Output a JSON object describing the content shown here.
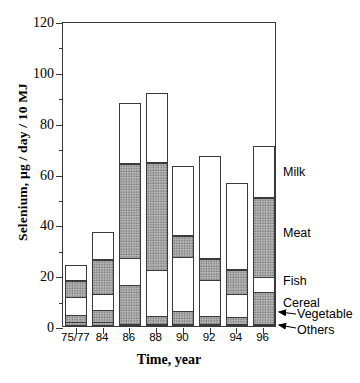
{
  "chart_data": {
    "type": "bar",
    "subtype": "stacked-vertical",
    "title": "",
    "xlabel": "Time, year",
    "ylabel": "Selenium, µg / day / 10 MJ",
    "categories": [
      "75/77",
      "84",
      "86",
      "88",
      "90",
      "92",
      "94",
      "96"
    ],
    "ylim": [
      0,
      120
    ],
    "yticks": [
      0,
      20,
      40,
      60,
      80,
      100,
      120
    ],
    "ytick_labels": [
      "0",
      "20",
      "40",
      "60",
      "80",
      "100",
      "120"
    ],
    "yminor_ticks": [
      10,
      30,
      50,
      70,
      90,
      110
    ],
    "grid": false,
    "legend_position": "right-inline-labels",
    "series": [
      {
        "name": "Others",
        "values": [
          0.8,
          0.8,
          0.8,
          0.8,
          0.8,
          0.8,
          0.8,
          0.8
        ]
      },
      {
        "name": "Vegetable",
        "values": [
          1.7,
          1.7,
          0.8,
          0.6,
          0.4,
          0.6,
          0.6,
          0.6
        ]
      },
      {
        "name": "Cereal",
        "values": [
          3.0,
          5.0,
          16.0,
          3.8,
          5.8,
          3.8,
          3.2,
          13.2
        ]
      },
      {
        "name": "Fish",
        "values": [
          7.5,
          7.0,
          10.8,
          18.2,
          21.4,
          14.6,
          9.6,
          6.3
        ]
      },
      {
        "name": "Meat",
        "values": [
          7.0,
          13.5,
          37.4,
          42.8,
          8.8,
          8.6,
          9.8,
          31.6
        ]
      },
      {
        "name": "Milk",
        "values": [
          6.0,
          11.0,
          24.2,
          27.4,
          27.6,
          40.6,
          34.2,
          20.2
        ]
      }
    ],
    "stack_boundaries": {
      "75/77": [
        0.8,
        2.5,
        5.5,
        13.0,
        20.0,
        26.0
      ],
      "84": [
        0.8,
        2.5,
        7.5,
        14.5,
        28.0,
        39.0
      ],
      "86": [
        0.8,
        1.6,
        17.6,
        28.4,
        65.8,
        90.0
      ],
      "88": [
        0.8,
        1.4,
        5.2,
        23.4,
        66.2,
        106.5
      ],
      "90": [
        0.8,
        1.2,
        7.0,
        28.4,
        87.0,
        114.5
      ],
      "92": [
        0.8,
        1.4,
        5.2,
        19.8,
        28.4,
        89.0
      ],
      "94": [
        0.8,
        1.4,
        4.6,
        14.2,
        24.0,
        58.2
      ],
      "96": [
        0.8,
        1.4,
        14.6,
        20.9,
        52.5,
        72.7
      ]
    },
    "totals": [
      26.0,
      39.0,
      90.0,
      106.5,
      114.5,
      89.0,
      58.2,
      72.7
    ],
    "annotations": [
      {
        "text": "Milk",
        "target": "milk-segment",
        "arrow": false
      },
      {
        "text": "Meat",
        "target": "meat-segment",
        "arrow": false
      },
      {
        "text": "Fish",
        "target": "fish-segment",
        "arrow": false
      },
      {
        "text": "Cereal",
        "target": "cereal-segment",
        "arrow": false
      },
      {
        "text": "Vegetable",
        "target": "vegetable-segment",
        "arrow": true
      },
      {
        "text": "Others",
        "target": "others-segment",
        "arrow": true
      }
    ]
  },
  "axis": {
    "y_title": "Selenium, µg / day / 10 MJ",
    "x_title": "Time, year",
    "y_labels": [
      "0",
      "20",
      "40",
      "60",
      "80",
      "100",
      "120"
    ],
    "x_labels": [
      "75/77",
      "84",
      "86",
      "88",
      "90",
      "92",
      "94",
      "96"
    ]
  },
  "labels": {
    "milk": "Milk",
    "meat": "Meat",
    "fish": "Fish",
    "cereal": "Cereal",
    "vegetable": "Vegetable",
    "others": "Others"
  },
  "colors": {
    "axis": "#3a3a3a",
    "fill_hatched": "#b4b4b4",
    "fill_plain": "#ffffff",
    "text": "#000000"
  }
}
